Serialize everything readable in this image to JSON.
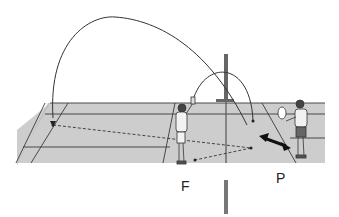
{
  "diagram": {
    "labels": {
      "player_f": "F",
      "player_p": "P"
    },
    "colors": {
      "court": "#cfcfcf",
      "court_front": "#c2c2c2",
      "lines": "#333333",
      "background": "#ffffff"
    }
  }
}
